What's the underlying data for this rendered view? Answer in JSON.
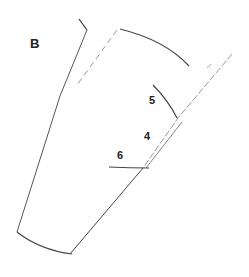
{
  "diagram": {
    "panel_label": "B",
    "labels": [
      {
        "id": "5",
        "text": "5"
      },
      {
        "id": "4",
        "text": "4"
      },
      {
        "id": "6",
        "text": "6"
      }
    ],
    "colors": {
      "stroke": "#333333",
      "faint_stroke": "#9a9a9a",
      "background": "#ffffff"
    }
  }
}
